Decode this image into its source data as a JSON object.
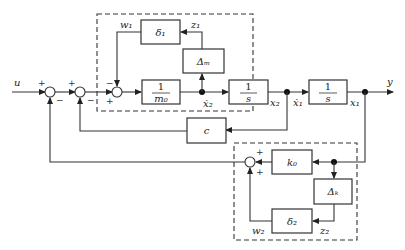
{
  "diagram": {
    "type": "block-diagram",
    "signals": {
      "input": "u",
      "output": "y",
      "x1": "x₁",
      "x1dot": "ẋ₁",
      "x2": "x₂",
      "x2dot": "ẋ₂",
      "w1": "w₁",
      "z1": "z₁",
      "w2": "w₂",
      "z2": "z₂"
    },
    "blocks": {
      "inv_m0": {
        "num": "1",
        "den": "m₀"
      },
      "integrator1": {
        "num": "1",
        "den": "s"
      },
      "integrator2": {
        "num": "1",
        "den": "s"
      },
      "delta1": "δ₁",
      "delta_m": "Δₘ",
      "c": "c",
      "k0": "k₀",
      "delta_k": "Δₖ",
      "delta2": "δ₂"
    },
    "signs": {
      "sum1_top": "+",
      "sum1_bottom": "−",
      "sum2_top": "+",
      "sum2_bottom": "−",
      "sum3_top": "−",
      "sum3_bottom": "+",
      "sum4_top": "+",
      "sum4_bottom": "+"
    }
  }
}
